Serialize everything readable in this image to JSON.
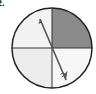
{
  "question": {
    "number": "2."
  },
  "spinner": {
    "sections": [
      {
        "name": "top-right",
        "fill": "#8a8a8a"
      },
      {
        "name": "top-left",
        "fill": "#f2f2f2"
      },
      {
        "name": "bottom-left",
        "fill": "#ececec"
      },
      {
        "name": "bottom-right",
        "fill": "#f6f6f6"
      }
    ],
    "outline_color": "#222222",
    "arrow_color": "#555555",
    "arrow": {
      "from": "upper-left",
      "points_to": "bottom-right"
    }
  }
}
